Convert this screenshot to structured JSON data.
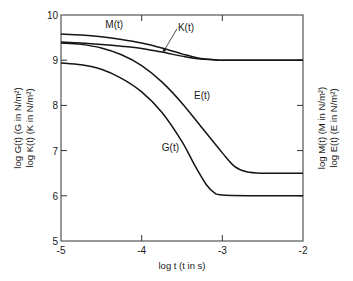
{
  "chart_data": {
    "type": "line",
    "title": "",
    "xlabel": "log t (t in s)",
    "ylabel_left": [
      "log G(t) (G in N/m²)",
      "log K(t) (K in N/m²)"
    ],
    "ylabel_right": [
      "log M(t) (M in N/m²)",
      "log E(t) (E in N/m²)"
    ],
    "xlim": [
      -5,
      -2
    ],
    "ylim": [
      5,
      10
    ],
    "x_ticks": [
      -5,
      -4,
      -3,
      -2
    ],
    "x_tick_labels": [
      "-5",
      "-4",
      "-3",
      "-2"
    ],
    "y_ticks": [
      5,
      6,
      7,
      8,
      9,
      10
    ],
    "y_tick_labels": [
      "5",
      "6",
      "7",
      "8",
      "9",
      "10"
    ],
    "grid": false,
    "legend": "none (curves labelled inline)",
    "series": [
      {
        "name": "M(t)",
        "label": "M(t)",
        "x": [
          -5.0,
          -4.75,
          -4.5,
          -4.25,
          -4.0,
          -3.75,
          -3.5,
          -3.3,
          -3.1,
          -3.0,
          -2.5,
          -2.0
        ],
        "y": [
          9.58,
          9.56,
          9.52,
          9.46,
          9.38,
          9.27,
          9.14,
          9.05,
          9.01,
          9.0,
          9.0,
          9.0
        ]
      },
      {
        "name": "K(t)",
        "label": "K(t)",
        "x": [
          -5.0,
          -4.75,
          -4.5,
          -4.25,
          -4.0,
          -3.75,
          -3.5,
          -3.3,
          -3.1,
          -3.0,
          -2.5,
          -2.0
        ],
        "y": [
          9.4,
          9.38,
          9.35,
          9.31,
          9.26,
          9.18,
          9.09,
          9.03,
          9.01,
          9.0,
          9.0,
          9.0
        ]
      },
      {
        "name": "E(t)",
        "label": "E(t)",
        "x": [
          -5.0,
          -4.75,
          -4.5,
          -4.25,
          -4.0,
          -3.75,
          -3.5,
          -3.25,
          -3.0,
          -2.85,
          -2.7,
          -2.5,
          -2.0
        ],
        "y": [
          9.38,
          9.35,
          9.27,
          9.12,
          8.88,
          8.52,
          8.05,
          7.5,
          6.95,
          6.65,
          6.53,
          6.5,
          6.5
        ]
      },
      {
        "name": "G(t)",
        "label": "G(t)",
        "x": [
          -5.0,
          -4.75,
          -4.5,
          -4.25,
          -4.0,
          -3.75,
          -3.5,
          -3.35,
          -3.2,
          -3.1,
          -3.0,
          -2.5,
          -2.0
        ],
        "y": [
          8.94,
          8.9,
          8.8,
          8.6,
          8.3,
          7.85,
          7.2,
          6.7,
          6.25,
          6.07,
          6.02,
          6.0,
          6.0
        ]
      }
    ],
    "annotations": [
      {
        "text": "M(t)",
        "x": -4.45,
        "y": 9.72,
        "target": "M(t)"
      },
      {
        "text": "K(t)",
        "x": -3.55,
        "y": 9.65,
        "target": "K(t)",
        "leader_to": [
          -3.72,
          9.22
        ]
      },
      {
        "text": "E(t)",
        "x": -3.35,
        "y": 8.15,
        "target": "E(t)"
      },
      {
        "text": "G(t)",
        "x": -3.75,
        "y": 7.0,
        "target": "G(t)"
      }
    ]
  }
}
